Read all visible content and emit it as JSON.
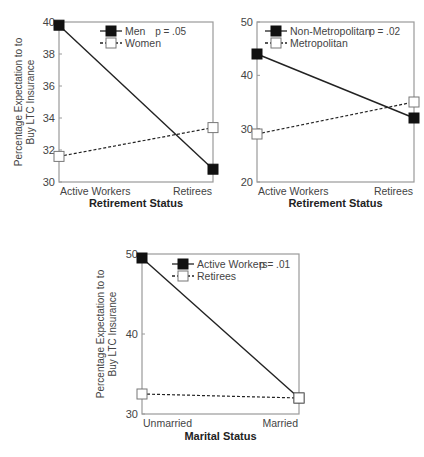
{
  "chart_data": [
    {
      "type": "line",
      "title": "",
      "xlabel": "Retirement Status",
      "ylabel": "Percentage Expectation to Buy LTC Insurance",
      "categories": [
        "Active Workers",
        "Retirees"
      ],
      "ylim": [
        30,
        40
      ],
      "yticks": [
        30,
        32,
        34,
        36,
        38,
        40
      ],
      "grid": false,
      "legend_position": "top-left inside",
      "annotation": "p = .05",
      "series": [
        {
          "name": "Men",
          "values": [
            39.8,
            30.8
          ],
          "marker": "filled-square",
          "line": "solid"
        },
        {
          "name": "Women",
          "values": [
            31.6,
            33.4
          ],
          "marker": "open-square",
          "line": "dashed"
        }
      ]
    },
    {
      "type": "line",
      "title": "",
      "xlabel": "Retirement Status",
      "ylabel": "",
      "categories": [
        "Active Workers",
        "Retirees"
      ],
      "ylim": [
        20,
        50
      ],
      "yticks": [
        20,
        30,
        40,
        50
      ],
      "grid": false,
      "legend_position": "top-left inside",
      "annotation": "p = .02",
      "series": [
        {
          "name": "Non-Metropolitan",
          "values": [
            44,
            32
          ],
          "marker": "filled-square",
          "line": "solid"
        },
        {
          "name": "Metropolitan",
          "values": [
            29,
            35
          ],
          "marker": "open-square",
          "line": "dashed"
        }
      ]
    },
    {
      "type": "line",
      "title": "",
      "xlabel": "Marital Status",
      "ylabel": "Percentage Expectation to Buy LTC Insurance",
      "categories": [
        "Unmarried",
        "Married"
      ],
      "ylim": [
        30,
        50
      ],
      "yticks": [
        30,
        40,
        50
      ],
      "grid": false,
      "legend_position": "top-left inside",
      "annotation": "p = .01",
      "series": [
        {
          "name": "Active Workers",
          "values": [
            49.5,
            32
          ],
          "marker": "filled-square",
          "line": "solid"
        },
        {
          "name": "Retirees",
          "values": [
            32.5,
            32
          ],
          "marker": "open-square",
          "line": "dashed"
        }
      ]
    }
  ],
  "layout": [
    {
      "left": 59,
      "top": 22,
      "right": 213,
      "bottom": 182,
      "xlabel_y": 207,
      "ylabel_x": 22,
      "legend_x": 100,
      "legend_y": 31,
      "pval_x": 186,
      "pval_y": 35
    },
    {
      "left": 257,
      "top": 22,
      "right": 414,
      "bottom": 182,
      "xlabel_y": 207,
      "ylabel_x": null,
      "legend_x": 265,
      "legend_y": 31,
      "pval_x": 400,
      "pval_y": 35
    },
    {
      "left": 142,
      "top": 254,
      "right": 299,
      "bottom": 414,
      "xlabel_y": 440,
      "ylabel_x": 104,
      "legend_x": 172,
      "legend_y": 264,
      "pval_x": 290,
      "pval_y": 268
    }
  ]
}
